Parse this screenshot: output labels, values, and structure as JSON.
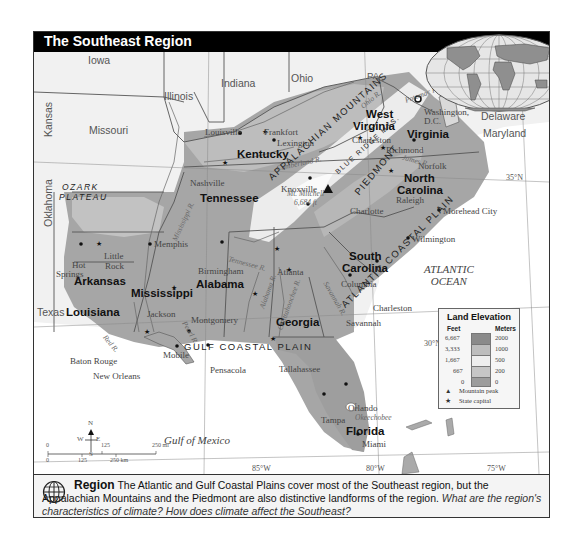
{
  "title": "The Southeast Region",
  "map": {
    "neighbor_states": [
      "Iowa",
      "Illinois",
      "Indiana",
      "Ohio",
      "PA",
      "Kansas",
      "Missouri",
      "Oklahoma",
      "Texas",
      "Delaware",
      "Maryland"
    ],
    "southeast_states": [
      "Kentucky",
      "West Virginia",
      "Virginia",
      "Tennessee",
      "North Carolina",
      "Arkansas",
      "Mississippi",
      "Alabama",
      "South Carolina",
      "Georgia",
      "Louisiana",
      "Florida"
    ],
    "labels": {
      "iowa": "Iowa",
      "illinois": "Illinois",
      "indiana": "Indiana",
      "ohio": "Ohio",
      "pa": "PA",
      "kansas": "Kansas",
      "missouri": "Missouri",
      "oklahoma": "Oklahoma",
      "texas": "Texas",
      "delaware": "Delaware",
      "maryland": "Maryland",
      "kentucky": "Kentucky",
      "west_virginia_1": "West",
      "west_virginia_2": "Virginia",
      "virginia": "Virginia",
      "tennessee": "Tennessee",
      "north_carolina_1": "North",
      "north_carolina_2": "Carolina",
      "arkansas": "Arkansas",
      "mississippi": "Mississippi",
      "alabama": "Alabama",
      "south_carolina_1": "South",
      "south_carolina_2": "Carolina",
      "georgia": "Georgia",
      "louisiana": "Louisiana",
      "florida": "Florida"
    },
    "cities": {
      "louisville": "Louisville",
      "frankfort": "Frankfort",
      "lexington": "Lexington",
      "charleston_wv": "Charleston",
      "washington_1": "Washington,",
      "washington_2": "D.C.",
      "richmond": "Richmond",
      "norfolk": "Norfolk",
      "nashville": "Nashville",
      "knoxville": "Knoxville",
      "raleigh": "Raleigh",
      "charlotte": "Charlotte",
      "morehead_city": "Morehead City",
      "wilmington": "Wilmington",
      "memphis": "Memphis",
      "hot_springs_1": "Hot",
      "hot_springs_2": "Springs",
      "little_rock_1": "Little",
      "little_rock_2": "Rock",
      "birmingham": "Birmingham",
      "atlanta": "Atlanta",
      "columbia": "Columbia",
      "charleston_sc": "Charleston",
      "savannah": "Savannah",
      "jackson": "Jackson",
      "montgomery": "Montgomery",
      "baton_rouge": "Baton Rouge",
      "new_orleans": "New Orleans",
      "mobile": "Mobile",
      "pensacola": "Pensacola",
      "tallahassee": "Tallahassee",
      "tampa": "Tampa",
      "orlando": "Orlando",
      "miami": "Miami",
      "mt_mitchell_1": "Mt. Mitchell",
      "mt_mitchell_2": "6,684 ft"
    },
    "rivers": {
      "ohio": "Ohio R.",
      "potomac": "Potomac R.",
      "cumberland": "Cumberland R.",
      "james": "James R.",
      "mississippi": "Mississippi R.",
      "tennessee": "Tennessee R.",
      "alabama": "Alabama R.",
      "chattahoochee": "Chattahoochee R.",
      "savannah": "Savannah R.",
      "red": "Red R.",
      "pearl": "Pearl R.",
      "okeechobee_1": "L.",
      "okeechobee_2": "Okeechobee"
    },
    "physical": {
      "ozark_1": "OZARK",
      "ozark_2": "PLATEAU",
      "appalachian": "APPALACHIAN MOUNTAINS",
      "blue_ridge": "BLUE RIDGE MTS.",
      "piedmont": "PIEDMONT",
      "atlantic_plain": "ATLANTIC COASTAL PLAIN",
      "gulf_plain": "GULF COASTAL PLAIN"
    },
    "water": {
      "atlantic_1": "ATLANTIC",
      "atlantic_2": "OCEAN",
      "gulf": "Gulf of Mexico"
    },
    "gridlines": {
      "lat_35": "35°N",
      "lat_30": "30°N",
      "lon_85": "85°W",
      "lon_80": "80°W",
      "lon_75": "75°W"
    },
    "compass": {
      "n": "N",
      "s": "S",
      "e": "E",
      "w": "W"
    },
    "scale": {
      "mi_0": "0",
      "mi_125": "125",
      "mi_250": "250 mi",
      "km_0": "0",
      "km_125": "125",
      "km_250": "250 km"
    }
  },
  "legend": {
    "title": "Land Elevation",
    "feet_header": "Feet",
    "meters_header": "Meters",
    "feet": [
      "6,667",
      "3,333",
      "1,667",
      "667",
      "0"
    ],
    "meters": [
      "2000",
      "1000",
      "500",
      "200",
      "0"
    ],
    "colors": [
      "#8a8a8a",
      "#bdbdbd",
      "#eeeeee",
      "#c6c6c6",
      "#9c9c9c"
    ],
    "mountain_peak": "Mountain peak",
    "state_capital": "State capital"
  },
  "caption": {
    "heading": "Region",
    "body": " The Atlantic and Gulf Coastal Plains cover most of the Southeast region, but the Appalachian Mountains and the Piedmont are also distinctive landforms of the region. ",
    "question": "What are the region's characteristics of climate? How does climate affect the Southeast?"
  }
}
